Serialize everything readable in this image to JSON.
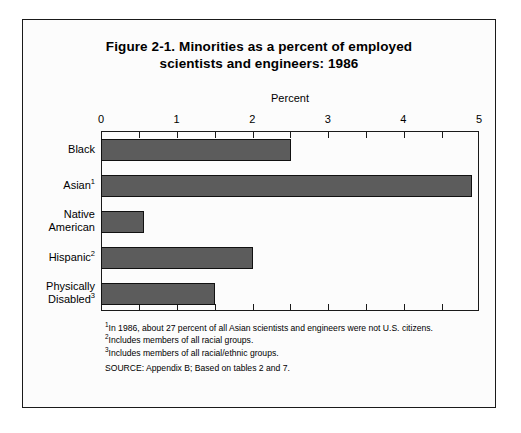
{
  "figure": {
    "title_line1": "Figure 2-1.  Minorities as a percent of employed",
    "title_line2": "scientists and engineers: 1986",
    "axis_header": "Percent",
    "footnotes": [
      {
        "marker": "1",
        "text": "In 1986, about 27 percent of all Asian scientists and engineers were not U.S. citizens."
      },
      {
        "marker": "2",
        "text": "Includes members of all racial groups."
      },
      {
        "marker": "3",
        "text": "Includes members of all racial/ethnic groups."
      }
    ],
    "source": "SOURCE:  Appendix B; Based on tables 2 and 7.",
    "colors": {
      "bar_fill": "#5c5c5c",
      "bar_stroke": "#111111",
      "frame": "#1a1a1a",
      "background": "#fcfcfc"
    }
  },
  "chart_data": {
    "type": "bar",
    "orientation": "horizontal",
    "title": "Figure 2-1.  Minorities as a percent of employed scientists and engineers: 1986",
    "xlabel": "Percent",
    "ylabel": "",
    "xlim": [
      0,
      5
    ],
    "xticks": [
      0,
      1,
      2,
      3,
      4,
      5
    ],
    "xtick_labels": [
      "0",
      "1",
      "2",
      "3",
      "4",
      "5"
    ],
    "minor_tick_step": 0.5,
    "grid": false,
    "legend": false,
    "categories": [
      "Black",
      "Asian¹",
      "Native American",
      "Hispanic²",
      "Physically Disabled³"
    ],
    "category_lines": [
      [
        "Black"
      ],
      [
        "Asian",
        "1"
      ],
      [
        "Native",
        "American"
      ],
      [
        "Hispanic",
        "2"
      ],
      [
        "Physically",
        "Disabled",
        "3"
      ]
    ],
    "values": [
      2.5,
      4.9,
      0.55,
      2.0,
      1.5
    ],
    "units": "percent"
  }
}
